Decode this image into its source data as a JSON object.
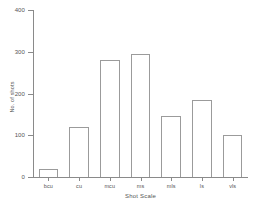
{
  "chart_data": {
    "type": "bar",
    "title": "",
    "subtitle": "",
    "xlabel": "Shot Scale",
    "ylabel": "No. of shots",
    "categories": [
      "bcu",
      "cu",
      "mcu",
      "ms",
      "mls",
      "ls",
      "vls"
    ],
    "values": [
      20,
      120,
      280,
      295,
      145,
      185,
      100
    ],
    "series": [
      {
        "name": "No. of shots",
        "values": [
          20,
          120,
          280,
          295,
          145,
          185,
          100
        ]
      }
    ],
    "ylim": [
      0,
      400
    ],
    "yticks": [
      0,
      100,
      200,
      300,
      400
    ],
    "ytick_labels": [
      "0",
      "100",
      "200",
      "300",
      "400"
    ],
    "xlim_categories": 7,
    "grid": false,
    "legend": false,
    "legend_position": "none",
    "bar_style": {
      "fill": "none",
      "edge_color": "#9b9b9b",
      "edge_width": 1
    },
    "axis_color": "#8a8a8a",
    "text_color": "#555555",
    "background": "#ffffff",
    "annotations": []
  }
}
